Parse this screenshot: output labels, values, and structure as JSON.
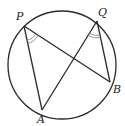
{
  "diagram": {
    "type": "circle-inscribed-angles",
    "circle": {
      "cx": 62,
      "cy": 65,
      "r": 54
    },
    "points": {
      "P": {
        "x": 24,
        "y": 26,
        "label": "P",
        "lx": 16,
        "ly": 20
      },
      "Q": {
        "x": 97,
        "y": 21,
        "label": "Q",
        "lx": 98,
        "ly": 16
      },
      "B": {
        "x": 110,
        "y": 82,
        "label": "B",
        "lx": 113,
        "ly": 93
      },
      "A": {
        "x": 42,
        "y": 110,
        "label": "A",
        "lx": 37,
        "ly": 123
      }
    },
    "segments": [
      [
        "P",
        "A"
      ],
      [
        "P",
        "B"
      ],
      [
        "Q",
        "A"
      ],
      [
        "Q",
        "B"
      ]
    ],
    "angle_marks": [
      "APB",
      "AQB"
    ],
    "stroke_color": "#2b2b2b",
    "mark_color": "#888888"
  }
}
